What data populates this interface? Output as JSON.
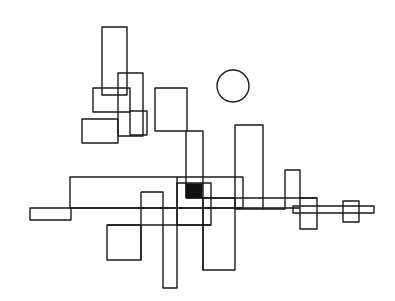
{
  "artwork": {
    "width": 395,
    "height": 301,
    "background": "#ffffff",
    "stroke_color": "#1a1a1a",
    "fill_color": "#111111",
    "rects": [
      {
        "name": "tall-rect-top-left",
        "x": 102,
        "y": 27,
        "w": 25,
        "h": 68
      },
      {
        "name": "rect-upper-middle",
        "x": 118,
        "y": 73,
        "w": 25,
        "h": 63
      },
      {
        "name": "rect-upper-wide",
        "x": 93,
        "y": 88,
        "w": 37,
        "h": 24
      },
      {
        "name": "rect-lower-left",
        "x": 82,
        "y": 119,
        "w": 36,
        "h": 24
      },
      {
        "name": "rect-small-right",
        "x": 130,
        "y": 111,
        "w": 17,
        "h": 24
      },
      {
        "name": "rect-center-square",
        "x": 155,
        "y": 88,
        "w": 32,
        "h": 43
      },
      {
        "name": "rect-big-horizontal",
        "x": 70,
        "y": 177,
        "w": 173,
        "h": 31
      },
      {
        "name": "rect-center-inner",
        "x": 177,
        "y": 183,
        "w": 34,
        "h": 42
      },
      {
        "name": "rect-small-left",
        "x": 30,
        "y": 208,
        "w": 41,
        "h": 12
      },
      {
        "name": "rect-bottom-left",
        "x": 107,
        "y": 225,
        "w": 34,
        "h": 35
      },
      {
        "name": "rect-bottom-tall",
        "x": 203,
        "y": 198,
        "w": 32,
        "h": 72
      },
      {
        "name": "rect-right-tall",
        "x": 235,
        "y": 125,
        "w": 28,
        "h": 84
      },
      {
        "name": "rect-right-small",
        "x": 300,
        "y": 198,
        "w": 17,
        "h": 31
      },
      {
        "name": "rect-right-long",
        "x": 293,
        "y": 206,
        "w": 81,
        "h": 7
      },
      {
        "name": "rect-right-square",
        "x": 343,
        "y": 201,
        "w": 16,
        "h": 21
      }
    ],
    "paths": [
      {
        "name": "path-center-connector",
        "d": "M187 131 L203 131 L203 270"
      },
      {
        "name": "path-vertical-186",
        "d": "M186 131 L186 198"
      },
      {
        "name": "path-long-horizontal",
        "d": "M71 208 L300 208"
      },
      {
        "name": "path-horizontal-198",
        "d": "M186 198 L317 198"
      },
      {
        "name": "path-horizontal-225",
        "d": "M107 225 L211 225"
      },
      {
        "name": "path-stem-141",
        "d": "M141 192 L163 192 L163 288 L177 288 L177 177"
      },
      {
        "name": "path-stem-141-down",
        "d": "M141 192 L141 260"
      },
      {
        "name": "path-step-right",
        "d": "M263 209 L285 209 L285 170 L300 170 L300 198"
      }
    ],
    "circle": {
      "name": "sun-circle",
      "cx": 233,
      "cy": 86,
      "r": 16
    },
    "filled_square": {
      "name": "filled-square",
      "x": 186,
      "y": 184,
      "w": 16,
      "h": 14
    }
  }
}
